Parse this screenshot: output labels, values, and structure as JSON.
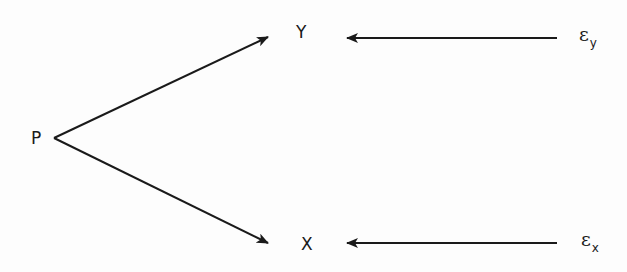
{
  "diagram": {
    "type": "path-diagram",
    "nodes": {
      "p": {
        "label": "P",
        "x": 32,
        "y": 129
      },
      "y": {
        "label": "Y",
        "x": 297,
        "y": 23
      },
      "x": {
        "label": "X",
        "x": 302,
        "y": 235
      },
      "eps_y": {
        "symbol": "ε",
        "subscript": "y",
        "x": 578,
        "y": 24
      },
      "eps_x": {
        "symbol": "ε",
        "subscript": "x",
        "x": 580,
        "y": 230
      }
    },
    "edges": [
      {
        "from": "P",
        "to": "Y",
        "x1": 54,
        "y1": 138,
        "x2": 268,
        "y2": 37
      },
      {
        "from": "P",
        "to": "X",
        "x1": 54,
        "y1": 138,
        "x2": 268,
        "y2": 243
      },
      {
        "from": "ε_y",
        "to": "Y",
        "x1": 557,
        "y1": 38,
        "x2": 347,
        "y2": 38
      },
      {
        "from": "ε_x",
        "to": "X",
        "x1": 557,
        "y1": 243,
        "x2": 347,
        "y2": 243
      }
    ],
    "colors": {
      "line": "#1a1a1a",
      "background": "#fdfdfd"
    }
  }
}
